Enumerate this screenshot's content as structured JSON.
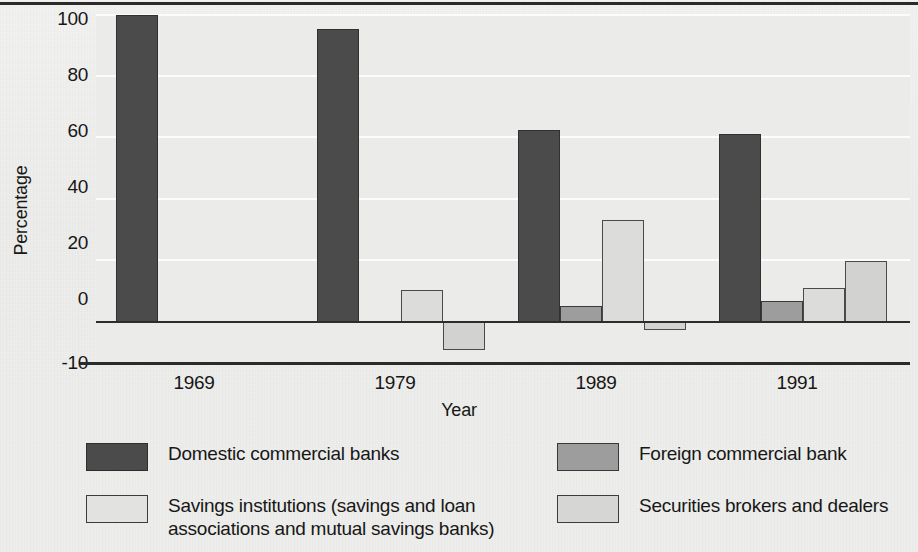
{
  "chart_data": {
    "type": "bar",
    "title": "",
    "xlabel": "Year",
    "ylabel": "Percentage",
    "categories": [
      "1969",
      "1979",
      "1989",
      "1991"
    ],
    "ylim": [
      -10,
      100
    ],
    "yticks": [
      -10,
      0,
      20,
      40,
      60,
      80,
      100
    ],
    "ytick_labels": [
      "-10",
      "0",
      "20",
      "40",
      "60",
      "80",
      "100"
    ],
    "grid": true,
    "grid_axis": "y",
    "legend_position": "below",
    "series": [
      {
        "name": "Domestic commercial banks",
        "color": "#4b4b4b",
        "values": [
          100,
          95.5,
          62.5,
          61
        ]
      },
      {
        "name": "Foreign commercial bank",
        "color": "#9d9d9d",
        "values": [
          0,
          0,
          4.8,
          6.5
        ]
      },
      {
        "name": "Savings institutions  (savings and loan\nassociations and mutual  savings banks)",
        "color": "#dcdcda",
        "values": [
          0,
          10,
          33,
          10.8
        ]
      },
      {
        "name": "Securities brokers  and dealers",
        "color": "#d2d2d0",
        "values": [
          0,
          -9.5,
          -3,
          19.5
        ]
      }
    ]
  },
  "axes": {
    "ylabel": "Percentage",
    "xlabel": "Year",
    "ytick_labels": [
      "100",
      "80",
      "60",
      "40",
      "20",
      "0",
      "-10"
    ],
    "xtick_labels": [
      "1969",
      "1979",
      "1989",
      "1991"
    ]
  },
  "legend": {
    "entries": [
      {
        "label": "Domestic commercial banks",
        "color": "#4b4b4b"
      },
      {
        "label": "Savings institutions  (savings and loan\nassociations and mutual  savings banks)",
        "color": "#dcdcda"
      },
      {
        "label": "Foreign commercial bank",
        "color": "#9d9d9d"
      },
      {
        "label": "Securities brokers  and dealers",
        "color": "#d2d2d0"
      }
    ]
  }
}
